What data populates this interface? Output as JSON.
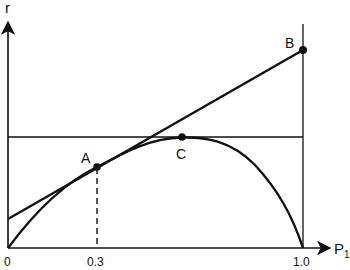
{
  "diagram": {
    "axes": {
      "y_label": "r",
      "x_label": "P",
      "x_label_subscript": "1",
      "x_ticks": [
        {
          "label": "0",
          "value": 0
        },
        {
          "label": "0.3",
          "value": 0.3
        },
        {
          "label": "1.0",
          "value": 1.0
        }
      ]
    },
    "points": [
      {
        "id": "A",
        "label": "A",
        "description": "tangent point of line with curve at P1 = 0.3"
      },
      {
        "id": "B",
        "label": "B",
        "description": "tangent line meets vertical at P1 = 1.0"
      },
      {
        "id": "C",
        "label": "C",
        "description": "maximum of curve, touching horizontal line"
      }
    ],
    "elements": {
      "curve": "concave curve from origin rising to maximum at C then falling to 0 at P1 = 1.0",
      "tangent_line": "straight line from positive r-intercept through A to B",
      "horizontal_line": "horizontal line at the level of the curve maximum C",
      "vertical_line": "vertical line at P1 = 1.0",
      "dashed_line": "vertical dashed line from A down to P1 = 0.3"
    },
    "colors": {
      "ink": "#111111",
      "background": "#ffffff"
    }
  }
}
